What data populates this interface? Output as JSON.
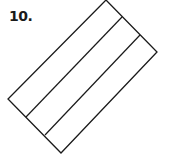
{
  "figure": {
    "number_label": "10.",
    "stroke_color": "#1a1a1a",
    "background": "#ffffff",
    "rectangle": {
      "corners": [
        [
          106,
          0
        ],
        [
          157,
          52
        ],
        [
          61,
          153
        ],
        [
          8,
          99
        ]
      ]
    },
    "dividers": [
      {
        "from": [
          122,
          17
        ],
        "to": [
          26,
          117
        ]
      },
      {
        "from": [
          140,
          35
        ],
        "to": [
          45,
          135
        ]
      }
    ],
    "strip_count": 3
  }
}
